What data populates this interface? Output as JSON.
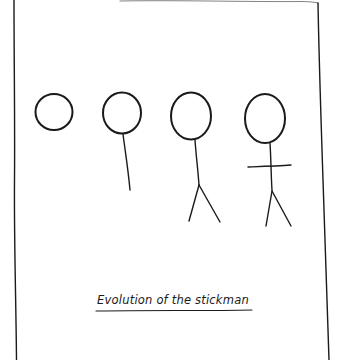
{
  "drawing": {
    "caption": "Evolution of the stickman",
    "stroke_color": "#1a1a1a",
    "background": "#ffffff",
    "figures": [
      {
        "name": "head-only",
        "parts": [
          "head"
        ]
      },
      {
        "name": "head-body",
        "parts": [
          "head",
          "body"
        ]
      },
      {
        "name": "head-body-legs",
        "parts": [
          "head",
          "body",
          "legs"
        ]
      },
      {
        "name": "head-body-arms-legs",
        "parts": [
          "head",
          "body",
          "arms",
          "legs"
        ]
      }
    ]
  }
}
